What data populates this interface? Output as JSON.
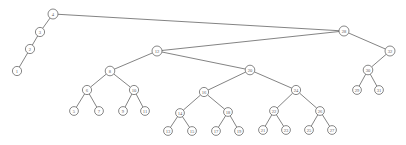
{
  "figure": {
    "kind": "tree-diagram",
    "background_color": "#ffffff",
    "node_fill": "#ffffff",
    "node_stroke": "#555555",
    "edge_color": "#4d4d4d",
    "label_color": "#5a5a5a"
  },
  "chart_data": {
    "type": "diagram",
    "subtype": "binary-tree",
    "title": "",
    "xlabel": "",
    "ylabel": "",
    "root": "4",
    "node_count": 35,
    "nodes": [
      {
        "id": "4",
        "label": "4",
        "x": 53,
        "y": 14,
        "r": 5.0,
        "depth": 0
      },
      {
        "id": "3",
        "label": "3",
        "x": 40,
        "y": 32,
        "r": 4.6,
        "depth": 1
      },
      {
        "id": "2",
        "label": "2",
        "x": 30,
        "y": 49,
        "r": 4.6,
        "depth": 2
      },
      {
        "id": "1",
        "label": "1",
        "x": 17,
        "y": 71,
        "r": 4.6,
        "depth": 3
      },
      {
        "id": "28",
        "label": "28",
        "x": 344,
        "y": 31,
        "r": 5.0,
        "depth": 1
      },
      {
        "id": "12",
        "label": "12",
        "x": 157,
        "y": 51,
        "r": 5.0,
        "depth": 2
      },
      {
        "id": "32",
        "label": "32",
        "x": 390,
        "y": 51,
        "r": 5.0,
        "depth": 2
      },
      {
        "id": "8",
        "label": "8",
        "x": 110,
        "y": 71,
        "r": 4.8,
        "depth": 3
      },
      {
        "id": "20",
        "label": "20",
        "x": 250,
        "y": 70,
        "r": 4.8,
        "depth": 3
      },
      {
        "id": "30",
        "label": "30",
        "x": 368,
        "y": 70,
        "r": 4.8,
        "depth": 3
      },
      {
        "id": "6",
        "label": "6",
        "x": 87,
        "y": 90,
        "r": 4.6,
        "depth": 4
      },
      {
        "id": "10",
        "label": "10",
        "x": 134,
        "y": 90,
        "r": 4.6,
        "depth": 4
      },
      {
        "id": "16",
        "label": "16",
        "x": 204,
        "y": 92,
        "r": 4.6,
        "depth": 4
      },
      {
        "id": "24",
        "label": "24",
        "x": 296,
        "y": 90,
        "r": 4.6,
        "depth": 4
      },
      {
        "id": "5",
        "label": "5",
        "x": 74,
        "y": 111,
        "r": 4.4,
        "depth": 5
      },
      {
        "id": "7",
        "label": "7",
        "x": 99,
        "y": 111,
        "r": 4.4,
        "depth": 5
      },
      {
        "id": "9",
        "label": "9",
        "x": 123,
        "y": 111,
        "r": 4.4,
        "depth": 5
      },
      {
        "id": "11",
        "label": "11",
        "x": 145,
        "y": 111,
        "r": 4.4,
        "depth": 5
      },
      {
        "id": "14",
        "label": "14",
        "x": 180,
        "y": 113,
        "r": 4.4,
        "depth": 5
      },
      {
        "id": "18",
        "label": "18",
        "x": 228,
        "y": 112,
        "r": 4.4,
        "depth": 5
      },
      {
        "id": "22",
        "label": "22",
        "x": 274,
        "y": 111,
        "r": 4.4,
        "depth": 5
      },
      {
        "id": "26",
        "label": "26",
        "x": 320,
        "y": 111,
        "r": 4.4,
        "depth": 5
      },
      {
        "id": "29",
        "label": "29",
        "x": 357,
        "y": 90,
        "r": 4.4,
        "depth": 4
      },
      {
        "id": "31",
        "label": "31",
        "x": 379,
        "y": 90,
        "r": 4.4,
        "depth": 4
      },
      {
        "id": "13",
        "label": "13",
        "x": 168,
        "y": 131,
        "r": 4.4,
        "depth": 6
      },
      {
        "id": "15",
        "label": "15",
        "x": 192,
        "y": 131,
        "r": 4.4,
        "depth": 6
      },
      {
        "id": "17",
        "label": "17",
        "x": 216,
        "y": 131,
        "r": 4.4,
        "depth": 6
      },
      {
        "id": "19",
        "label": "19",
        "x": 239,
        "y": 131,
        "r": 4.4,
        "depth": 6
      },
      {
        "id": "21",
        "label": "21",
        "x": 263,
        "y": 130,
        "r": 4.4,
        "depth": 6
      },
      {
        "id": "23",
        "label": "23",
        "x": 286,
        "y": 130,
        "r": 4.4,
        "depth": 6
      },
      {
        "id": "25",
        "label": "25",
        "x": 309,
        "y": 130,
        "r": 4.4,
        "depth": 6
      },
      {
        "id": "27",
        "label": "27",
        "x": 332,
        "y": 130,
        "r": 4.4,
        "depth": 6
      }
    ],
    "edges": [
      {
        "from": "4",
        "to": "3"
      },
      {
        "from": "3",
        "to": "2"
      },
      {
        "from": "2",
        "to": "1"
      },
      {
        "from": "4",
        "to": "28"
      },
      {
        "from": "28",
        "to": "12"
      },
      {
        "from": "28",
        "to": "32"
      },
      {
        "from": "12",
        "to": "8"
      },
      {
        "from": "12",
        "to": "20"
      },
      {
        "from": "32",
        "to": "30"
      },
      {
        "from": "8",
        "to": "6"
      },
      {
        "from": "8",
        "to": "10"
      },
      {
        "from": "20",
        "to": "16"
      },
      {
        "from": "20",
        "to": "24"
      },
      {
        "from": "6",
        "to": "5"
      },
      {
        "from": "6",
        "to": "7"
      },
      {
        "from": "10",
        "to": "9"
      },
      {
        "from": "10",
        "to": "11"
      },
      {
        "from": "16",
        "to": "14"
      },
      {
        "from": "16",
        "to": "18"
      },
      {
        "from": "24",
        "to": "22"
      },
      {
        "from": "24",
        "to": "26"
      },
      {
        "from": "30",
        "to": "29"
      },
      {
        "from": "30",
        "to": "31"
      },
      {
        "from": "14",
        "to": "13"
      },
      {
        "from": "14",
        "to": "15"
      },
      {
        "from": "18",
        "to": "17"
      },
      {
        "from": "18",
        "to": "19"
      },
      {
        "from": "22",
        "to": "21"
      },
      {
        "from": "22",
        "to": "23"
      },
      {
        "from": "26",
        "to": "25"
      },
      {
        "from": "26",
        "to": "27"
      }
    ]
  }
}
